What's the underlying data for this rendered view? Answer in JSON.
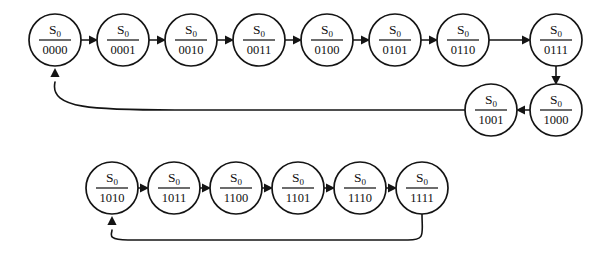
{
  "figure": {
    "name": "state-transition-diagram",
    "background_color": "#ffffff",
    "line_color": "#141414",
    "state_prefix": "S",
    "state_subscript": "0"
  },
  "geometry": {
    "width": 615,
    "height": 258,
    "radius": 26,
    "row1_y": 40,
    "row2_y": 110,
    "row3_y": 188,
    "row1_x_start": 55,
    "row1_pitch": 68,
    "row3_x_start": 112,
    "row3_pitch": 62
  },
  "rows": [
    {
      "name": "row-top",
      "nodes": [
        {
          "id": "n0000",
          "label_num": "S",
          "label_sub": "0",
          "label_den": "0000",
          "cx": 55,
          "cy": 40
        },
        {
          "id": "n0001",
          "label_num": "S",
          "label_sub": "0",
          "label_den": "0001",
          "cx": 123,
          "cy": 40
        },
        {
          "id": "n0010",
          "label_num": "S",
          "label_sub": "0",
          "label_den": "0010",
          "cx": 191,
          "cy": 40
        },
        {
          "id": "n0011",
          "label_num": "S",
          "label_sub": "0",
          "label_den": "0011",
          "cx": 259,
          "cy": 40
        },
        {
          "id": "n0100",
          "label_num": "S",
          "label_sub": "0",
          "label_den": "0100",
          "cx": 327,
          "cy": 40
        },
        {
          "id": "n0101",
          "label_num": "S",
          "label_sub": "0",
          "label_den": "0101",
          "cx": 395,
          "cy": 40
        },
        {
          "id": "n0110",
          "label_num": "S",
          "label_sub": "0",
          "label_den": "0110",
          "cx": 463,
          "cy": 40
        },
        {
          "id": "n0111",
          "label_num": "S",
          "label_sub": "0",
          "label_den": "0111",
          "cx": 556,
          "cy": 40
        }
      ]
    },
    {
      "name": "row-middle",
      "nodes": [
        {
          "id": "n1001",
          "label_num": "S",
          "label_sub": "0",
          "label_den": "1001",
          "cx": 491,
          "cy": 110
        },
        {
          "id": "n1000",
          "label_num": "S",
          "label_sub": "0",
          "label_den": "1000",
          "cx": 556,
          "cy": 110
        }
      ]
    },
    {
      "name": "row-bottom",
      "nodes": [
        {
          "id": "n1010",
          "label_num": "S",
          "label_sub": "0",
          "label_den": "1010",
          "cx": 112,
          "cy": 188
        },
        {
          "id": "n1011",
          "label_num": "S",
          "label_sub": "0",
          "label_den": "1011",
          "cx": 174,
          "cy": 188
        },
        {
          "id": "n1100",
          "label_num": "S",
          "label_sub": "0",
          "label_den": "1100",
          "cx": 236,
          "cy": 188
        },
        {
          "id": "n1101",
          "label_num": "S",
          "label_sub": "0",
          "label_den": "1101",
          "cx": 298,
          "cy": 188
        },
        {
          "id": "n1110",
          "label_num": "S",
          "label_sub": "0",
          "label_den": "1110",
          "cx": 360,
          "cy": 188
        },
        {
          "id": "n1111",
          "label_num": "S",
          "label_sub": "0",
          "label_den": "1111",
          "cx": 422,
          "cy": 188
        }
      ]
    }
  ],
  "edges": [
    {
      "name": "edge-0000-0001",
      "from": "n0000",
      "to": "n0001",
      "kind": "straight-right"
    },
    {
      "name": "edge-0001-0010",
      "from": "n0001",
      "to": "n0010",
      "kind": "straight-right"
    },
    {
      "name": "edge-0010-0011",
      "from": "n0010",
      "to": "n0011",
      "kind": "straight-right"
    },
    {
      "name": "edge-0011-0100",
      "from": "n0011",
      "to": "n0100",
      "kind": "straight-right"
    },
    {
      "name": "edge-0100-0101",
      "from": "n0100",
      "to": "n0101",
      "kind": "straight-right"
    },
    {
      "name": "edge-0101-0110",
      "from": "n0101",
      "to": "n0110",
      "kind": "straight-right"
    },
    {
      "name": "edge-0110-0111",
      "from": "n0110",
      "to": "n0111",
      "kind": "straight-right"
    },
    {
      "name": "edge-0111-1000",
      "from": "n0111",
      "to": "n1000",
      "kind": "straight-down"
    },
    {
      "name": "edge-1000-1001",
      "from": "n1000",
      "to": "n1001",
      "kind": "straight-left"
    },
    {
      "name": "edge-1001-0000",
      "from": "n1001",
      "to": "n0000",
      "kind": "feedback-curve"
    },
    {
      "name": "edge-1010-1011",
      "from": "n1010",
      "to": "n1011",
      "kind": "straight-right"
    },
    {
      "name": "edge-1011-1100",
      "from": "n1011",
      "to": "n1100",
      "kind": "straight-right"
    },
    {
      "name": "edge-1100-1101",
      "from": "n1100",
      "to": "n1101",
      "kind": "straight-right"
    },
    {
      "name": "edge-1101-1110",
      "from": "n1101",
      "to": "n1110",
      "kind": "straight-right"
    },
    {
      "name": "edge-1110-1111",
      "from": "n1110",
      "to": "n1111",
      "kind": "straight-right"
    },
    {
      "name": "edge-1111-1010",
      "from": "n1111",
      "to": "n1010",
      "kind": "feedback-curve"
    }
  ]
}
